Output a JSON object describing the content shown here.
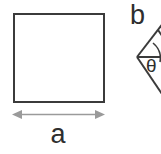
{
  "figure": {
    "background_color": "#ffffff",
    "width": 161,
    "height": 154,
    "shapes": [
      {
        "id": "square",
        "kind": "square",
        "label": "a",
        "stroke_color": "#3b3b3b",
        "stroke_width": 2,
        "x": 13,
        "y": 13,
        "width": 91,
        "height": 89
      },
      {
        "id": "rhombus",
        "kind": "rhombus-partial",
        "label": "b",
        "angle_label": "θ",
        "stroke_color": "#3b3b3b",
        "stroke_width": 2,
        "left_vertex_x": 137,
        "left_vertex_y": 57,
        "clipped": true
      }
    ],
    "dimension": {
      "id": "width-dimension",
      "label": "a",
      "line_color": "#9a9a9a",
      "x_start": 13,
      "x_end": 104,
      "y": 114,
      "arrowheads": "both"
    },
    "labels": {
      "side_a": "a",
      "side_b": "b",
      "angle_theta": "θ"
    }
  }
}
